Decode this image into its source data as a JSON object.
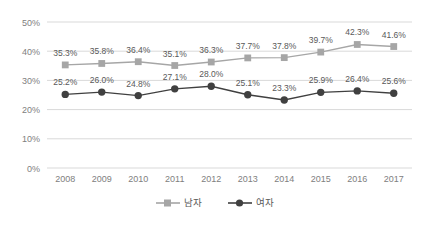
{
  "chart_data": {
    "type": "line",
    "title": "",
    "subtitle": "",
    "xlabel": "",
    "ylabel": "",
    "categories": [
      "2008",
      "2009",
      "2010",
      "2011",
      "2012",
      "2013",
      "2014",
      "2015",
      "2016",
      "2017"
    ],
    "series": [
      {
        "name": "남자",
        "color": "#a6a6a6",
        "marker": "square",
        "values": [
          35.3,
          35.8,
          36.4,
          35.1,
          36.3,
          37.7,
          37.8,
          39.7,
          42.3,
          41.6
        ],
        "labels": [
          "35.3%",
          "35.8%",
          "36.4%",
          "35.1%",
          "36.3%",
          "37.7%",
          "37.8%",
          "39.7%",
          "42.3%",
          "41.6%"
        ]
      },
      {
        "name": "여자",
        "color": "#404040",
        "marker": "circle",
        "values": [
          25.2,
          26.0,
          24.8,
          27.1,
          28.0,
          25.1,
          23.3,
          25.9,
          26.4,
          25.6
        ],
        "labels": [
          "25.2%",
          "26.0%",
          "24.8%",
          "27.1%",
          "28.0%",
          "25.1%",
          "23.3%",
          "25.9%",
          "26.4%",
          "25.6%"
        ]
      }
    ],
    "ylim": [
      0,
      50
    ],
    "ytick_values": [
      0,
      10,
      20,
      30,
      40,
      50
    ],
    "ytick_labels": [
      "0%",
      "10%",
      "20%",
      "30%",
      "40%",
      "50%"
    ],
    "grid": true,
    "grid_axis": "y",
    "grid_color": "#d9d9d9",
    "legend_position": "bottom",
    "legend": [
      "남자",
      "여자"
    ]
  },
  "legend": {
    "items": [
      {
        "label": "남자"
      },
      {
        "label": "여자"
      }
    ]
  }
}
